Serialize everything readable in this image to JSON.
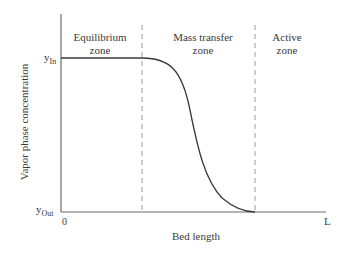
{
  "diagram": {
    "type": "breakthrough-profile",
    "axes": {
      "x_label": "Bed length",
      "y_label": "Vapor phase concentration",
      "x_origin_label": "0",
      "x_end_label": "L",
      "y_high_label": {
        "base": "y",
        "sub": "In"
      },
      "y_low_label": {
        "base": "y",
        "sub": "Out"
      }
    },
    "zones": [
      {
        "line1": "Equilibrium",
        "line2": "zone"
      },
      {
        "line1": "Mass transfer",
        "line2": "zone"
      },
      {
        "line1": "Active",
        "line2": "zone"
      }
    ],
    "colors": {
      "axis": "#6b6b6b",
      "curve": "#3a3a3a",
      "dashed": "#9a9a9a",
      "text": "#3a3a3a"
    }
  }
}
